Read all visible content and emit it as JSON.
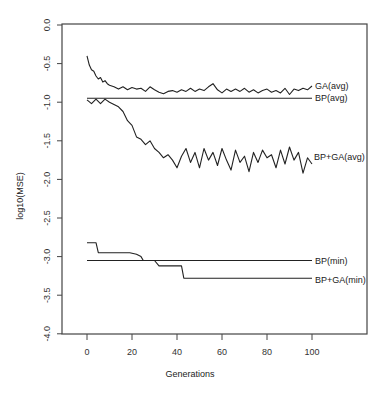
{
  "chart_data": {
    "type": "line",
    "title": "",
    "xlabel": "Generations",
    "ylabel": "log10(MSE)",
    "xlim": [
      -10,
      120
    ],
    "ylim": [
      -4.0,
      0.0
    ],
    "x_ticks": [
      0,
      20,
      40,
      60,
      80,
      100
    ],
    "x_tick_labels": [
      "0",
      "20",
      "40",
      "60",
      "80",
      "100"
    ],
    "y_ticks": [
      0.0,
      -0.5,
      -1.0,
      -1.5,
      -2.0,
      -2.5,
      -3.0,
      -3.5,
      -4.0
    ],
    "y_tick_labels": [
      "0.0",
      "-0.5",
      "-1.0",
      "-1.5",
      "-2.0",
      "-2.5",
      "-3.0",
      "-3.5",
      "-4.0"
    ],
    "grid": false,
    "legend": "inline labels at right end of each series",
    "series": [
      {
        "name": "GA(avg)",
        "x": [
          0,
          1,
          2,
          3,
          4,
          5,
          6,
          7,
          8,
          9,
          10,
          12,
          14,
          16,
          18,
          20,
          22,
          24,
          26,
          28,
          30,
          32,
          34,
          36,
          38,
          40,
          42,
          44,
          46,
          48,
          50,
          52,
          54,
          56,
          58,
          60,
          62,
          64,
          66,
          68,
          70,
          72,
          74,
          76,
          78,
          80,
          82,
          84,
          86,
          88,
          90,
          92,
          94,
          96,
          98,
          100
        ],
        "values": [
          -0.4,
          -0.52,
          -0.58,
          -0.6,
          -0.66,
          -0.7,
          -0.68,
          -0.74,
          -0.72,
          -0.76,
          -0.78,
          -0.8,
          -0.83,
          -0.8,
          -0.84,
          -0.81,
          -0.83,
          -0.82,
          -0.86,
          -0.8,
          -0.84,
          -0.87,
          -0.89,
          -0.86,
          -0.85,
          -0.87,
          -0.84,
          -0.86,
          -0.82,
          -0.86,
          -0.83,
          -0.85,
          -0.8,
          -0.76,
          -0.84,
          -0.88,
          -0.83,
          -0.86,
          -0.83,
          -0.86,
          -0.82,
          -0.87,
          -0.84,
          -0.88,
          -0.85,
          -0.83,
          -0.87,
          -0.85,
          -0.88,
          -0.82,
          -0.9,
          -0.83,
          -0.85,
          -0.82,
          -0.84,
          -0.79
        ]
      },
      {
        "name": "BP(avg)",
        "x": [
          0,
          100
        ],
        "values": [
          -0.95,
          -0.95
        ]
      },
      {
        "name": "BP+GA(avg)",
        "x": [
          0,
          2,
          4,
          6,
          8,
          10,
          12,
          14,
          16,
          18,
          20,
          22,
          24,
          26,
          28,
          30,
          32,
          34,
          36,
          38,
          40,
          42,
          44,
          46,
          48,
          50,
          52,
          54,
          56,
          58,
          60,
          62,
          64,
          66,
          68,
          70,
          72,
          74,
          76,
          78,
          80,
          82,
          84,
          86,
          88,
          90,
          92,
          94,
          96,
          98,
          100
        ],
        "values": [
          -0.97,
          -1.02,
          -0.96,
          -1.02,
          -0.96,
          -1.0,
          -1.03,
          -1.06,
          -1.12,
          -1.24,
          -1.3,
          -1.45,
          -1.48,
          -1.55,
          -1.5,
          -1.6,
          -1.65,
          -1.72,
          -1.68,
          -1.75,
          -1.85,
          -1.7,
          -1.6,
          -1.78,
          -1.65,
          -1.85,
          -1.6,
          -1.75,
          -1.65,
          -1.82,
          -1.6,
          -1.75,
          -1.88,
          -1.62,
          -1.78,
          -1.7,
          -1.9,
          -1.65,
          -1.78,
          -1.62,
          -1.72,
          -1.68,
          -1.85,
          -1.62,
          -1.8,
          -1.58,
          -1.75,
          -1.65,
          -1.92,
          -1.72,
          -1.8
        ]
      },
      {
        "name": "BP(min)",
        "x": [
          0,
          100
        ],
        "values": [
          -3.05,
          -3.05
        ]
      },
      {
        "name": "BP+GA(min)",
        "x": [
          0,
          4,
          5,
          19,
          22,
          24,
          25,
          30,
          32,
          42,
          43,
          100
        ],
        "values": [
          -2.82,
          -2.82,
          -2.95,
          -2.95,
          -2.97,
          -3.0,
          -3.05,
          -3.05,
          -3.12,
          -3.12,
          -3.28,
          -3.28
        ]
      }
    ]
  },
  "labels": {
    "ga_avg": "GA(avg)",
    "bp_avg": "BP(avg)",
    "bpga_avg": "BP+GA(avg)",
    "bp_min": "BP(min)",
    "bpga_min": "BP+GA(min)",
    "xlabel": "Generations",
    "ylabel": "log10(MSE)",
    "x_ticks": [
      "0",
      "20",
      "40",
      "60",
      "80",
      "100"
    ],
    "y_ticks": [
      "0.0",
      "-0.5",
      "-1.0",
      "-1.5",
      "-2.0",
      "-2.5",
      "-3.0",
      "-3.5",
      "-4.0"
    ]
  }
}
